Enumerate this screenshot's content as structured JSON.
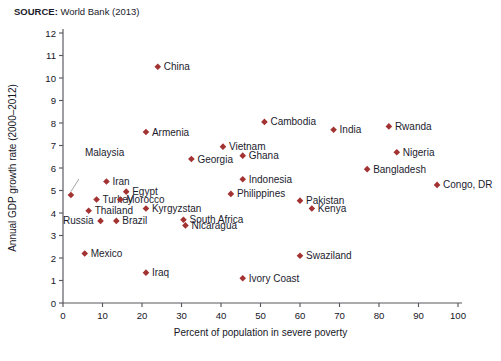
{
  "source": {
    "label": "SOURCE:",
    "text": " World Bank (2013)"
  },
  "chart_data": {
    "type": "scatter",
    "title": "",
    "xlabel": "Percent of population in severe poverty",
    "ylabel": "Annual GDP growth rate (2000–2012)",
    "xlim": [
      0,
      100
    ],
    "ylim": [
      0,
      12
    ],
    "xticks": [
      0,
      10,
      20,
      30,
      40,
      50,
      60,
      70,
      80,
      90,
      100
    ],
    "yticks": [
      0,
      1,
      2,
      3,
      4,
      5,
      6,
      7,
      8,
      9,
      10,
      11,
      12
    ],
    "grid": false,
    "legend": "none",
    "marker_color": "#a33232",
    "points": [
      {
        "label": "Malaysia",
        "x": 2.0,
        "y": 4.8,
        "lx": 14,
        "ly": 39,
        "anchor": "start",
        "leader": true
      },
      {
        "label": "Iran",
        "x": 11.0,
        "y": 5.4,
        "lx": 6,
        "ly": 3.5,
        "anchor": "start",
        "leader": false
      },
      {
        "label": "Turkey",
        "x": 8.5,
        "y": 4.6,
        "lx": 6,
        "ly": 3.5,
        "anchor": "start",
        "leader": false
      },
      {
        "label": "Thailand",
        "x": 6.5,
        "y": 4.1,
        "lx": 6,
        "ly": 3.5,
        "anchor": "start",
        "leader": false
      },
      {
        "label": "Russia",
        "x": 9.5,
        "y": 3.65,
        "lx": -7,
        "ly": 3.5,
        "anchor": "end",
        "leader": false
      },
      {
        "label": "Brazil",
        "x": 13.5,
        "y": 3.65,
        "lx": 6,
        "ly": 3.5,
        "anchor": "start",
        "leader": false
      },
      {
        "label": "Mexico",
        "x": 5.5,
        "y": 2.2,
        "lx": 6,
        "ly": 3.5,
        "anchor": "start",
        "leader": false
      },
      {
        "label": "Egypt",
        "x": 16.0,
        "y": 4.95,
        "lx": 6,
        "ly": 3.5,
        "anchor": "start",
        "leader": false
      },
      {
        "label": "Morocco",
        "x": 14.5,
        "y": 4.6,
        "lx": 6,
        "ly": 3.5,
        "anchor": "start",
        "leader": false
      },
      {
        "label": "Armenia",
        "x": 21.0,
        "y": 7.6,
        "lx": 6,
        "ly": 3.5,
        "anchor": "start",
        "leader": false
      },
      {
        "label": "China",
        "x": 24.0,
        "y": 10.5,
        "lx": 6,
        "ly": 3.5,
        "anchor": "start",
        "leader": false
      },
      {
        "label": "Iraq",
        "x": 21.0,
        "y": 1.35,
        "lx": 6,
        "ly": 3.5,
        "anchor": "start",
        "leader": false
      },
      {
        "label": "Kyrgyzstan",
        "x": 21.0,
        "y": 4.2,
        "lx": 6,
        "ly": 3.5,
        "anchor": "start",
        "leader": false
      },
      {
        "label": "South Africa",
        "x": 30.5,
        "y": 3.7,
        "lx": 6,
        "ly": 3.5,
        "anchor": "start",
        "leader": false
      },
      {
        "label": "Nicaragua",
        "x": 31.0,
        "y": 3.45,
        "lx": 6,
        "ly": 3.5,
        "anchor": "start",
        "leader": false
      },
      {
        "label": "Georgia",
        "x": 32.5,
        "y": 6.4,
        "lx": 6,
        "ly": 3.5,
        "anchor": "start",
        "leader": false
      },
      {
        "label": "Vietnam",
        "x": 40.5,
        "y": 6.95,
        "lx": 6,
        "ly": 3.5,
        "anchor": "start",
        "leader": false
      },
      {
        "label": "Philippines",
        "x": 42.5,
        "y": 4.85,
        "lx": 6,
        "ly": 3.5,
        "anchor": "start",
        "leader": false
      },
      {
        "label": "Indonesia",
        "x": 45.5,
        "y": 5.5,
        "lx": 6,
        "ly": 3.5,
        "anchor": "start",
        "leader": false
      },
      {
        "label": "Ghana",
        "x": 45.5,
        "y": 6.55,
        "lx": 6,
        "ly": 3.5,
        "anchor": "start",
        "leader": false
      },
      {
        "label": "Ivory Coast",
        "x": 45.5,
        "y": 1.1,
        "lx": 6,
        "ly": 3.5,
        "anchor": "start",
        "leader": false
      },
      {
        "label": "Cambodia",
        "x": 51.0,
        "y": 8.05,
        "lx": 6,
        "ly": 3.5,
        "anchor": "start",
        "leader": false
      },
      {
        "label": "Pakistan",
        "x": 60.0,
        "y": 4.55,
        "lx": 6,
        "ly": 3.5,
        "anchor": "start",
        "leader": false
      },
      {
        "label": "Kenya",
        "x": 63.0,
        "y": 4.2,
        "lx": 6,
        "ly": 3.5,
        "anchor": "start",
        "leader": false
      },
      {
        "label": "Swaziland",
        "x": 60.0,
        "y": 2.1,
        "lx": 6,
        "ly": 3.5,
        "anchor": "start",
        "leader": false
      },
      {
        "label": "India",
        "x": 68.5,
        "y": 7.7,
        "lx": 6,
        "ly": 3.5,
        "anchor": "start",
        "leader": false
      },
      {
        "label": "Rwanda",
        "x": 82.5,
        "y": 7.85,
        "lx": 6,
        "ly": 3.5,
        "anchor": "start",
        "leader": false
      },
      {
        "label": "Nigeria",
        "x": 84.5,
        "y": 6.7,
        "lx": 6,
        "ly": 3.5,
        "anchor": "start",
        "leader": false
      },
      {
        "label": "Bangladesh",
        "x": 77.0,
        "y": 5.95,
        "lx": 6,
        "ly": 3.5,
        "anchor": "start",
        "leader": false
      },
      {
        "label": "Congo, DR",
        "x": 94.7,
        "y": 5.25,
        "lx": 6,
        "ly": 3.5,
        "anchor": "start",
        "leader": false
      }
    ]
  }
}
